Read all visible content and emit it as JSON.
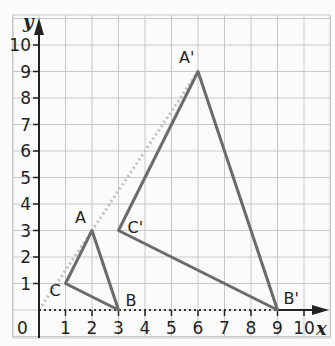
{
  "diagram": {
    "type": "coordinate-plane-dilation",
    "axes": {
      "x_label": "x",
      "y_label": "y",
      "x_ticks": [
        "1",
        "2",
        "3",
        "4",
        "5",
        "6",
        "7",
        "8",
        "9",
        "10"
      ],
      "y_ticks": [
        "1",
        "2",
        "3",
        "4",
        "5",
        "6",
        "7",
        "8",
        "9",
        "10"
      ],
      "origin_label": "0",
      "x_range": [
        0,
        10
      ],
      "y_range": [
        0,
        10
      ]
    },
    "original_triangle": {
      "vertices": [
        {
          "label": "A",
          "x": 2,
          "y": 3
        },
        {
          "label": "B",
          "x": 3,
          "y": 0
        },
        {
          "label": "C",
          "x": 1,
          "y": 1
        }
      ]
    },
    "image_triangle": {
      "vertices": [
        {
          "label": "A'",
          "x": 6,
          "y": 9
        },
        {
          "label": "B'",
          "x": 9,
          "y": 0
        },
        {
          "label": "C'",
          "x": 3,
          "y": 3
        }
      ]
    },
    "guide_lines": [
      {
        "from": [
          0,
          0
        ],
        "to": [
          6,
          9
        ],
        "style": "dotted"
      },
      {
        "from": [
          0,
          0
        ],
        "to": [
          9,
          0
        ],
        "style": "dotted"
      }
    ],
    "colors": {
      "grid": "#c8c8c8",
      "triangle": "#6b6b6b",
      "axis": "#222222",
      "guide": "#c0c0c0"
    }
  }
}
